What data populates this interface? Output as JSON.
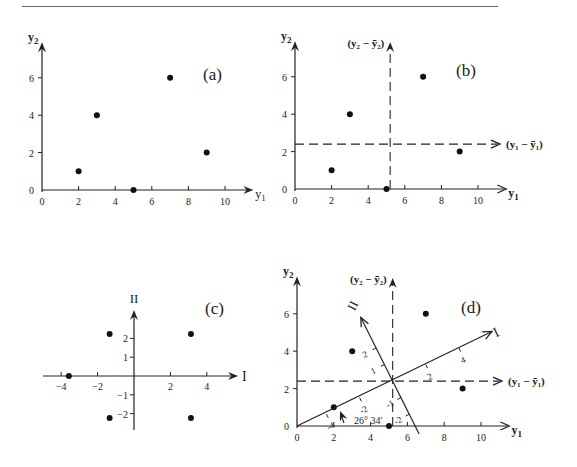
{
  "chart_data": [
    {
      "panel": "(a)",
      "type": "scatter",
      "title": "(a)",
      "xlabel": "y1",
      "ylabel": "y2",
      "xticks": [
        0,
        2,
        4,
        6,
        8,
        10
      ],
      "yticks": [
        0,
        2,
        4,
        6
      ],
      "xlim": [
        0,
        11
      ],
      "ylim": [
        0,
        7.9
      ],
      "points": [
        [
          2,
          1
        ],
        [
          3,
          4
        ],
        [
          5,
          0
        ],
        [
          7,
          6
        ],
        [
          9,
          2
        ]
      ]
    },
    {
      "panel": "(b)",
      "type": "scatter",
      "title": "(b)",
      "xlabel": "y1",
      "ylabel": "y2",
      "xticks": [
        0,
        2,
        4,
        6,
        8,
        10
      ],
      "yticks": [
        0,
        2,
        4,
        6
      ],
      "xlim": [
        0,
        11
      ],
      "ylim": [
        0,
        7.9
      ],
      "points": [
        [
          2,
          1
        ],
        [
          3,
          4
        ],
        [
          5,
          0
        ],
        [
          7,
          6
        ],
        [
          9,
          2
        ]
      ],
      "mean": [
        5.2,
        2.4
      ],
      "centered_axis_labels": {
        "horizontal": "(y₁ − ȳ₁)",
        "vertical": "(y₂ − ȳ₂)"
      }
    },
    {
      "panel": "(c)",
      "type": "scatter",
      "title": "(c)",
      "xlabel": "I",
      "ylabel": "II",
      "xticks": [
        -4,
        -2,
        2,
        4
      ],
      "yticks": [
        -2,
        -1,
        1,
        2
      ],
      "xlim": [
        -5,
        5.8
      ],
      "ylim": [
        -2.8,
        3.5
      ],
      "points": [
        [
          -3.58,
          0
        ],
        [
          -1.34,
          2.24
        ],
        [
          3.13,
          2.24
        ],
        [
          -1.34,
          -2.24
        ],
        [
          3.13,
          -2.24
        ]
      ]
    },
    {
      "panel": "(d)",
      "type": "scatter",
      "title": "(d)",
      "xlabel": "y1",
      "ylabel": "y2",
      "xticks": [
        0,
        2,
        4,
        6,
        8,
        10
      ],
      "yticks": [
        0,
        2,
        4,
        6
      ],
      "xlim": [
        0,
        11
      ],
      "ylim": [
        0,
        8
      ],
      "points": [
        [
          2,
          1
        ],
        [
          3,
          4
        ],
        [
          5,
          0
        ],
        [
          7,
          6
        ],
        [
          9,
          2
        ]
      ],
      "mean": [
        5.2,
        2.4
      ],
      "centered_axis_labels": {
        "horizontal": "(y₁ − ȳ₁)",
        "vertical": "(y₂ − ȳ₂)"
      },
      "rotated_axes": {
        "labels": [
          "I",
          "II"
        ],
        "angle_label": "26° 34′",
        "angle_deg": 26.57,
        "I_ticks": [
          -4,
          -2,
          2,
          4
        ],
        "II_ticks": [
          -2,
          -1,
          1,
          2
        ]
      }
    }
  ],
  "labels": {
    "a": "(a)",
    "b": "(b)",
    "c": "(c)",
    "d": "(d)",
    "y1": "y",
    "y1_sub": "1",
    "y2": "y",
    "y2_sub": "2",
    "I": "I",
    "II": "II",
    "c1": "(y₁ − ȳ₁)",
    "c2": "(y₂ − ȳ₂)",
    "angle": "26° 34′"
  }
}
